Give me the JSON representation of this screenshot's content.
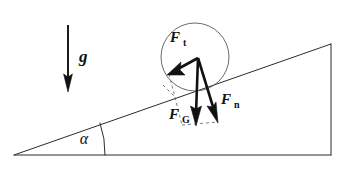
{
  "figure": {
    "background_color": "#ffffff",
    "line_color": "#2b2b2b",
    "vector_color": "#111111",
    "construction_color": "#6e6e6e",
    "width": 344,
    "height": 169
  },
  "incline": {
    "name": "inclined-plane-triangle",
    "apex_left": "14,155",
    "corner_bottom_right": "331,155",
    "corner_top_right": "331,44",
    "angle_label": "α",
    "angle_arc_center_x": 105,
    "angle_degrees": 19
  },
  "body": {
    "name": "ball-on-incline",
    "shape": "circle",
    "center_x": 195,
    "center_y": 57,
    "radius": 34
  },
  "gravity_indicator": {
    "label": "g",
    "direction": "down",
    "x": 68,
    "y_start": 25,
    "y_end": 90
  },
  "vectors": [
    {
      "id": "F_t",
      "label": "F",
      "subscript": "t",
      "meaning": "tangential-force-along-slope",
      "origin": "198,58",
      "tip": "169,74",
      "label_x": 175,
      "label_y": 42
    },
    {
      "id": "F_G",
      "label": "F",
      "subscript": "G",
      "meaning": "weight-gravitational-force",
      "origin": "198,58",
      "tip": "196,125",
      "label_x": 174,
      "label_y": 119
    },
    {
      "id": "F_n",
      "label": "F",
      "subscript": "n",
      "meaning": "normal-force-perpendicular-to-slope",
      "origin": "198,58",
      "tip": "218,122",
      "label_x": 222,
      "label_y": 104
    }
  ],
  "construction_lines": [
    {
      "id": "dash-left-side",
      "meaning": "parallelogram-side-from-Ft-tip",
      "from": "169,74",
      "to": "182,125"
    },
    {
      "id": "dash-bottom",
      "meaning": "parallelogram-side-joining-FG-and-Fn-tips",
      "from": "182,125",
      "to": "218,122"
    },
    {
      "id": "dash-slope-marker",
      "meaning": "short-perpendicular-tick-on-slope",
      "from": "163,85",
      "to": "176,98"
    }
  ]
}
